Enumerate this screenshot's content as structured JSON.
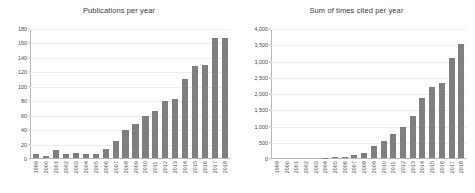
{
  "chart_data": [
    {
      "type": "bar",
      "title": "Publications per year",
      "xlabel": "",
      "ylabel": "",
      "ylim": [
        0,
        180
      ],
      "yticks": [
        "0",
        "20",
        "40",
        "60",
        "80",
        "100",
        "120",
        "140",
        "160",
        "180"
      ],
      "ytick_values": [
        0,
        20,
        40,
        60,
        80,
        100,
        120,
        140,
        160,
        180
      ],
      "grid": true,
      "legend": "none",
      "bar_color": "#7f7f7f",
      "categories": [
        "1999",
        "2000",
        "2001",
        "2002",
        "2003",
        "2004",
        "2005",
        "2006",
        "2007",
        "2008",
        "2009",
        "2010",
        "2011",
        "2012",
        "2013",
        "2014",
        "2015",
        "2016",
        "2017",
        "2018"
      ],
      "values": [
        5,
        3,
        11,
        5,
        7,
        6,
        6,
        12,
        24,
        39,
        48,
        59,
        65,
        80,
        83,
        110,
        128,
        130,
        168,
        167
      ]
    },
    {
      "type": "bar",
      "title": "Sum of times cited per year",
      "xlabel": "",
      "ylabel": "",
      "ylim": [
        0,
        4000
      ],
      "yticks": [
        "0",
        "500",
        "1,000",
        "1,500",
        "2,000",
        "2,500",
        "3,000",
        "3,500",
        "4,000"
      ],
      "ytick_values": [
        0,
        500,
        1000,
        1500,
        2000,
        2500,
        3000,
        3500,
        4000
      ],
      "grid": true,
      "legend": "none",
      "bar_color": "#7f7f7f",
      "categories": [
        "1999",
        "2000",
        "2001",
        "2002",
        "2003",
        "2004",
        "2005",
        "2006",
        "2007",
        "2008",
        "2009",
        "2010",
        "2011",
        "2012",
        "2013",
        "2014",
        "2015",
        "2016",
        "2017",
        "2018"
      ],
      "values": [
        0,
        0,
        0,
        0,
        0,
        5,
        20,
        40,
        80,
        160,
        370,
        540,
        740,
        970,
        1310,
        1860,
        2210,
        2320,
        3100,
        3520
      ]
    }
  ]
}
